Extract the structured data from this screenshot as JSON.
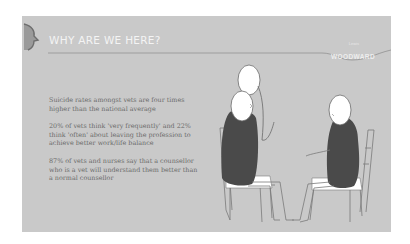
{
  "slide": {
    "title": "WHY ARE WE HERE?",
    "brand": {
      "small": "Lewis",
      "name": "WOODWARD"
    },
    "points": [
      "Suicide rates amongst vets are four times higher than the national average",
      "20% of vets think 'very frequently' and 22% think 'often' about leaving the profession to achieve better work/life balance",
      "87% of vets and  nurses say that a counsellor who is a vet will understand them better than a normal counsellor"
    ],
    "illustration": "counselling-session-two-seated-figures",
    "colors": {
      "background": "#c9c9c9",
      "title": "#f4f4f4",
      "body_text": "#6a6a6a",
      "figure_body": "#4a4a4a"
    }
  }
}
